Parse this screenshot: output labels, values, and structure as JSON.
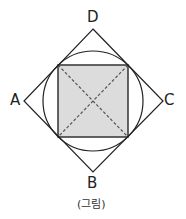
{
  "diagram": {
    "labels": {
      "A": "A",
      "B": "B",
      "C": "C",
      "D": "D"
    },
    "caption": "(그림)",
    "colors": {
      "stroke": "#222222",
      "square_fill": "#dcdcdc",
      "diagonal": "#555555"
    }
  }
}
